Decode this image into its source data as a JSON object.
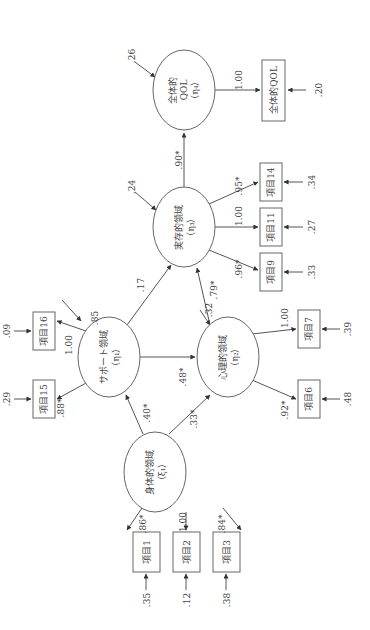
{
  "diagram": {
    "orientation": "rotated 90° counter-clockwise",
    "latent": {
      "overall_qol": {
        "line1": "全体的",
        "line2": "QOL",
        "line3": "（η₄）",
        "disturbance": ".26"
      },
      "existential": {
        "line1": "実存的領域",
        "line2": "（η₃）",
        "disturbance": ".24"
      },
      "support": {
        "line1": "サポート領域",
        "line2": "（η₁）",
        "disturbance": ".85"
      },
      "psychological": {
        "line1": "心理的領域",
        "line2": "（η₂）",
        "disturbance": ".32"
      },
      "physical": {
        "line1": "身体的領域",
        "line2": "（ξ₁）"
      }
    },
    "observed": {
      "overall_qol_item": {
        "label": "全体的QOL",
        "error": ".20",
        "loading": "1.00"
      },
      "item14": {
        "label": "項目14",
        "error": ".34",
        "loading": ".95*"
      },
      "item11": {
        "label": "項目11",
        "error": ".27",
        "loading": "1.00"
      },
      "item9": {
        "label": "項目9",
        "error": ".33",
        "loading": ".96*"
      },
      "item16": {
        "label": "項目16",
        "error": ".09",
        "loading": "1.00"
      },
      "item15": {
        "label": "項目15",
        "error": ".29",
        "loading": ".88*"
      },
      "item7": {
        "label": "項目7",
        "error": ".39",
        "loading": "1.00"
      },
      "item6": {
        "label": "項目6",
        "error": ".48",
        "loading": ".92*"
      },
      "item1": {
        "label": "項目1",
        "error": ".35",
        "loading": ".86*"
      },
      "item2": {
        "label": "項目2",
        "error": ".12",
        "loading": "1.00"
      },
      "item3": {
        "label": "項目3",
        "error": ".38",
        "loading": ".84*"
      }
    },
    "paths": {
      "existential_to_overall": ".90*",
      "support_to_existential": ".17",
      "psychological_to_existential": ".79*",
      "support_to_psychological": ".48*",
      "physical_to_support": ".40*",
      "physical_to_psychological": ".33*"
    }
  }
}
